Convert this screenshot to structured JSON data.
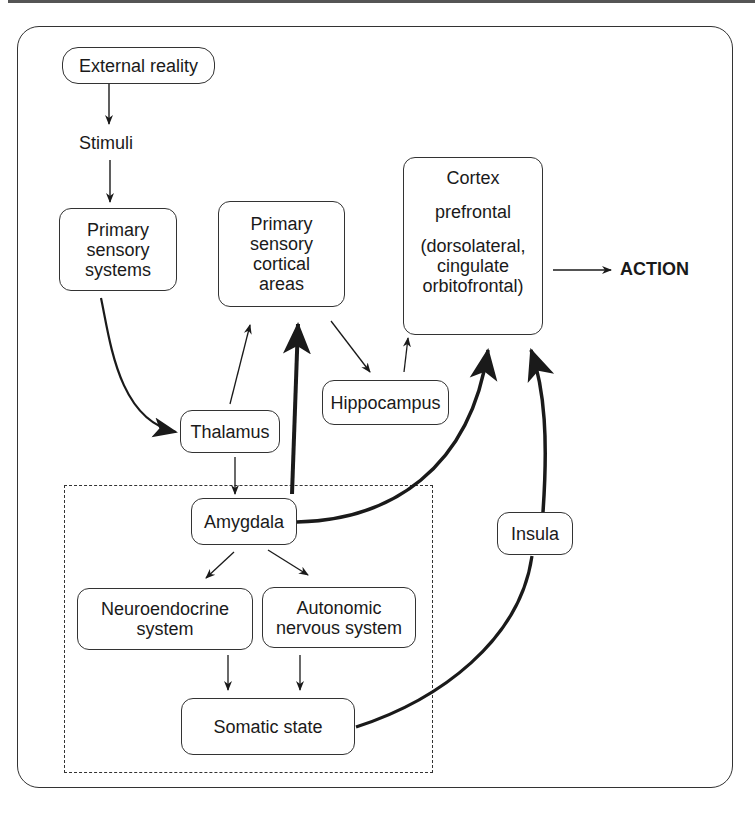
{
  "diagram": {
    "nodes": {
      "external_reality": "External reality",
      "stimuli": "Stimuli",
      "primary_sensory_systems": [
        "Primary",
        "sensory",
        "systems"
      ],
      "primary_sensory_cortical_areas": [
        "Primary",
        "sensory",
        "cortical",
        "areas"
      ],
      "cortex": {
        "title": "Cortex",
        "subtitle": "prefrontal",
        "detail": [
          "(dorsolateral,",
          "cingulate",
          "orbitofrontal)"
        ]
      },
      "action": "ACTION",
      "thalamus": "Thalamus",
      "hippocampus": "Hippocampus",
      "amygdala": "Amygdala",
      "insula": "Insula",
      "neuroendocrine_system": [
        "Neuroendocrine",
        "system"
      ],
      "autonomic_nervous_system": [
        "Autonomic",
        "nervous system"
      ],
      "somatic_state": "Somatic state"
    },
    "edges": [
      {
        "from": "External reality",
        "to": "Stimuli",
        "weight": "thin"
      },
      {
        "from": "Stimuli",
        "to": "Primary sensory systems",
        "weight": "thin"
      },
      {
        "from": "Primary sensory systems",
        "to": "Thalamus",
        "weight": "medium-curved"
      },
      {
        "from": "Thalamus",
        "to": "Primary sensory cortical areas",
        "weight": "thin"
      },
      {
        "from": "Thalamus",
        "to": "Amygdala",
        "weight": "thin"
      },
      {
        "from": "Amygdala",
        "to": "Primary sensory cortical areas",
        "weight": "thick"
      },
      {
        "from": "Primary sensory cortical areas",
        "to": "Hippocampus",
        "weight": "thin"
      },
      {
        "from": "Hippocampus",
        "to": "Cortex prefrontal",
        "weight": "thin"
      },
      {
        "from": "Amygdala",
        "to": "Cortex prefrontal",
        "weight": "thick-curved"
      },
      {
        "from": "Amygdala",
        "to": "Neuroendocrine system",
        "weight": "thin"
      },
      {
        "from": "Amygdala",
        "to": "Autonomic nervous system",
        "weight": "thin"
      },
      {
        "from": "Neuroendocrine system",
        "to": "Somatic state",
        "weight": "thin"
      },
      {
        "from": "Autonomic nervous system",
        "to": "Somatic state",
        "weight": "thin"
      },
      {
        "from": "Somatic state",
        "to": "Insula",
        "weight": "thick-curved"
      },
      {
        "from": "Insula",
        "to": "Cortex prefrontal",
        "weight": "thick-curved"
      },
      {
        "from": "Cortex prefrontal",
        "to": "ACTION",
        "weight": "thin"
      }
    ],
    "colors": {
      "stroke": "#1a1a1a",
      "background": "#ffffff"
    }
  }
}
